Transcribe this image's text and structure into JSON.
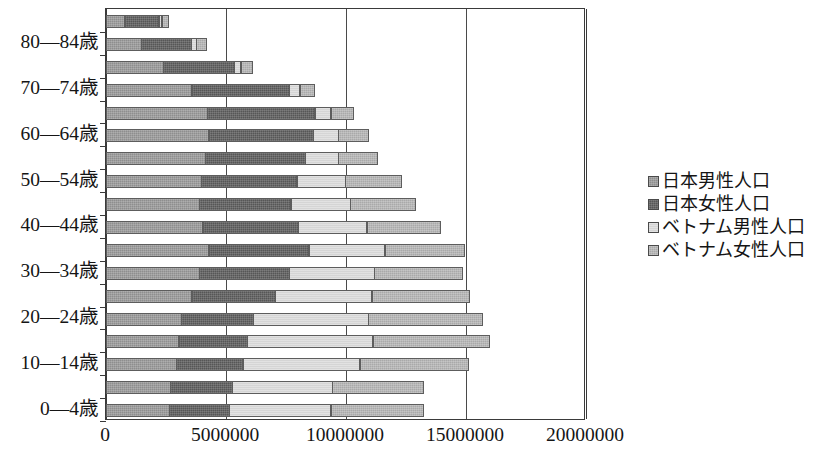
{
  "chart_data": {
    "type": "bar",
    "orientation": "horizontal",
    "stacked": true,
    "title": "",
    "xlabel": "",
    "ylabel": "",
    "xlim": [
      0,
      20000000
    ],
    "xticks": [
      0,
      5000000,
      10000000,
      15000000,
      20000000
    ],
    "xtick_labels": [
      "0",
      "5000000",
      "10000000",
      "15000000",
      "20000000"
    ],
    "grid": true,
    "legend_position": "right",
    "categories": [
      "0—4歳",
      "5—9歳",
      "10—14歳",
      "15—19歳",
      "20—24歳",
      "25—29歳",
      "30—34歳",
      "35—39歳",
      "40—44歳",
      "45—49歳",
      "50—54歳",
      "55—59歳",
      "60—64歳",
      "65—69歳",
      "70—74歳",
      "75—79歳",
      "80—84歳",
      "85歳以上"
    ],
    "visible_tick_labels": [
      "0—4歳",
      "10—14歳",
      "20—24歳",
      "30—34歳",
      "40—44歳",
      "50—54歳",
      "60—64歳",
      "70—74歳",
      "80—84歳"
    ],
    "series": [
      {
        "name": "日本男性人口",
        "color": "#8e8e8e",
        "values": [
          2650000,
          2700000,
          2950000,
          3050000,
          3150000,
          3600000,
          3900000,
          4300000,
          4050000,
          3900000,
          4000000,
          4150000,
          4300000,
          4250000,
          3600000,
          2400000,
          1500000,
          800000
        ]
      },
      {
        "name": "日本女性人口",
        "color": "#565656",
        "values": [
          2550000,
          2600000,
          2800000,
          2900000,
          3050000,
          3500000,
          3800000,
          4200000,
          4000000,
          3850000,
          4000000,
          4200000,
          4400000,
          4500000,
          4100000,
          3000000,
          2100000,
          1450000
        ]
      },
      {
        "name": "ベトナム男性人口",
        "color": "#d5d5d5",
        "values": [
          4250000,
          4200000,
          4900000,
          5250000,
          4800000,
          4050000,
          3550000,
          3200000,
          2900000,
          2500000,
          2050000,
          1400000,
          1050000,
          700000,
          450000,
          300000,
          250000,
          150000
        ]
      },
      {
        "name": "ベトナム女性人口",
        "color": "#a9a9a9",
        "values": [
          3900000,
          3850000,
          4550000,
          4900000,
          4800000,
          4100000,
          3700000,
          3350000,
          3100000,
          2750000,
          2350000,
          1650000,
          1300000,
          950000,
          650000,
          500000,
          450000,
          300000
        ]
      }
    ],
    "totals": [
      13350000,
      13350000,
      15200000,
      16100000,
      15800000,
      15250000,
      14950000,
      15050000,
      14050000,
      13000000,
      12400000,
      11400000,
      11050000,
      10400000,
      8800000,
      6200000,
      4300000,
      2700000
    ]
  },
  "axis": {
    "x_tick_labels": [
      "0",
      "5000000",
      "10000000",
      "15000000",
      "20000000"
    ],
    "y_tick_labels": [
      "0—4歳",
      "10—14歳",
      "20—24歳",
      "30—34歳",
      "40—44歳",
      "50—54歳",
      "60—64歳",
      "70—74歳",
      "80—84歳"
    ]
  },
  "legend": {
    "items": [
      {
        "label": "日本男性人口",
        "color": "#8e8e8e",
        "swatch": "jp-m"
      },
      {
        "label": "日本女性人口",
        "color": "#565656",
        "swatch": "jp-f"
      },
      {
        "label": "ベトナム男性人口",
        "color": "#d5d5d5",
        "swatch": "vn-m"
      },
      {
        "label": "ベトナム女性人口",
        "color": "#a9a9a9",
        "swatch": "vn-f"
      }
    ]
  }
}
